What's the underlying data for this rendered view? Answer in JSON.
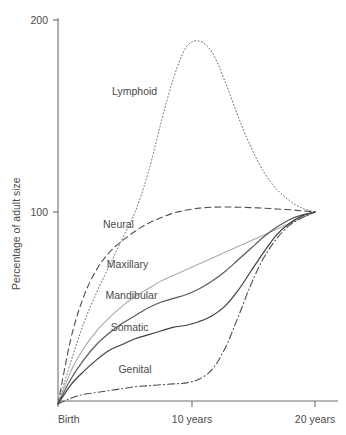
{
  "chart_data": {
    "type": "line",
    "title": "",
    "xlabel": "",
    "ylabel": "Percentage of adult size",
    "xlim": [
      0,
      20
    ],
    "ylim": [
      0,
      200
    ],
    "grid": false,
    "legend_position": "inline-labels",
    "x_unit": "years",
    "xticks": [
      {
        "value": 0,
        "label": "Birth"
      },
      {
        "value": 10,
        "label": "10 years"
      },
      {
        "value": 20,
        "label": "20 years"
      }
    ],
    "yticks": [
      {
        "value": 100,
        "label": "100"
      },
      {
        "value": 200,
        "label": "200"
      }
    ],
    "x": [
      0,
      1,
      2,
      3,
      4,
      5,
      6,
      7,
      8,
      9,
      10,
      11,
      12,
      13,
      14,
      15,
      16,
      17,
      18,
      19,
      20
    ],
    "series": [
      {
        "name": "Lymphoid",
        "label": "Lymphoid",
        "style": "dotted",
        "color": "#6b6b6b",
        "width": 1.0,
        "label_x": 4.2,
        "label_y": 163,
        "values": [
          0,
          22,
          42,
          58,
          72,
          86,
          100,
          120,
          146,
          170,
          186,
          189,
          183,
          168,
          150,
          134,
          121,
          112,
          106,
          102,
          100
        ]
      },
      {
        "name": "Neural",
        "label": "Neural",
        "style": "dashed",
        "color": "#4f4f4f",
        "width": 1.1,
        "label_x": 3.5,
        "label_y": 94,
        "values": [
          0,
          34,
          56,
          70,
          79,
          85,
          90,
          94,
          97,
          99.5,
          101,
          102,
          102.5,
          102.6,
          102.5,
          102.3,
          102,
          101.6,
          101.2,
          100.6,
          100
        ]
      },
      {
        "name": "Maxillary",
        "label": "Maxillary",
        "style": "solid",
        "color": "#a9a9a9",
        "width": 1.1,
        "label_x": 3.8,
        "label_y": 73,
        "values": [
          0,
          17,
          29,
          38,
          45,
          51,
          56,
          60,
          64,
          67,
          70,
          73,
          76,
          79,
          82,
          85,
          88,
          91,
          94,
          97,
          100
        ]
      },
      {
        "name": "Mandibular",
        "label": "Mandibular",
        "style": "solid",
        "color": "#585858",
        "width": 1.2,
        "label_x": 3.7,
        "label_y": 57,
        "values": [
          0,
          13,
          23,
          31,
          37,
          42,
          46,
          50,
          53,
          55,
          57,
          60,
          64,
          69,
          75,
          81,
          87,
          92,
          96,
          98.5,
          100
        ]
      },
      {
        "name": "Somatic",
        "label": "Somatic",
        "style": "solid",
        "color": "#3f3f3f",
        "width": 1.2,
        "label_x": 4.1,
        "label_y": 40,
        "values": [
          0,
          10,
          17,
          23,
          28,
          31,
          34,
          36,
          38,
          40,
          41,
          43,
          46,
          51,
          59,
          69,
          79,
          88,
          94,
          98,
          100
        ]
      },
      {
        "name": "Genital",
        "label": "Genital",
        "style": "dash-dot",
        "color": "#4f4f4f",
        "width": 1.1,
        "label_x": 4.7,
        "label_y": 18,
        "values": [
          0,
          3,
          5,
          6,
          7,
          8,
          9,
          9.5,
          10,
          10.5,
          11,
          13,
          18,
          29,
          45,
          62,
          76,
          86,
          93,
          97,
          100
        ]
      }
    ]
  },
  "axes": {
    "y_title": "Percentage of adult size",
    "y_tick_top": "200",
    "y_tick_mid": "100",
    "x_tick_left": "Birth",
    "x_tick_mid": "10 years",
    "x_tick_right": "20 years"
  },
  "labels": {
    "lymphoid": "Lymphoid",
    "neural": "Neural",
    "maxillary": "Maxillary",
    "mandibular": "Mandibular",
    "somatic": "Somatic",
    "genital": "Genital"
  }
}
